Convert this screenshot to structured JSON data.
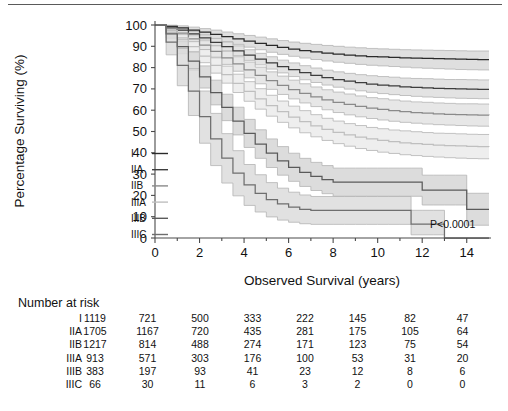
{
  "figure": {
    "p_value": "P<0.0001",
    "top_rule": true
  },
  "chart_data": {
    "type": "line",
    "title": "",
    "xlabel": "Observed Survival (years)",
    "ylabel": "Percentage Surviving (%)",
    "xlim": [
      0,
      15
    ],
    "ylim": [
      0,
      100
    ],
    "xticks": [
      0,
      2,
      4,
      6,
      8,
      10,
      12,
      14
    ],
    "xticklabels": [
      "0",
      "2",
      "4",
      "6",
      "8",
      "10",
      "12",
      "14"
    ],
    "yticks": [
      0,
      10,
      20,
      30,
      40,
      50,
      60,
      70,
      80,
      90,
      100
    ],
    "yticklabels": [
      "0",
      "10",
      "20",
      "30",
      "40",
      "50",
      "60",
      "70",
      "80",
      "90",
      "100"
    ],
    "grid": false,
    "legend_position": "inside-left",
    "annotation": "P<0.0001",
    "series": [
      {
        "name": "I",
        "color": "#2a2a2a",
        "band_color": "#d9d9d9",
        "x": [
          0,
          0.5,
          1,
          1.5,
          2,
          2.5,
          3,
          3.5,
          4,
          4.5,
          5,
          5.5,
          6,
          6.5,
          7,
          7.5,
          8,
          8.5,
          9,
          9.5,
          10,
          10.5,
          11,
          11.5,
          12,
          12.5,
          13,
          13.5,
          14,
          14.5,
          15
        ],
        "values": [
          100,
          99.4,
          98.6,
          97.6,
          96.6,
          95.6,
          94.5,
          93.5,
          92.4,
          91.4,
          90.4,
          89.5,
          88.7,
          88.0,
          87.4,
          86.8,
          86.3,
          85.9,
          85.5,
          85.2,
          85.0,
          84.8,
          84.6,
          84.4,
          84.3,
          84.2,
          84.1,
          84.0,
          83.9,
          83.8,
          83.8
        ],
        "lower": [
          100,
          98.6,
          97.4,
          96.1,
          94.8,
          93.5,
          92.2,
          90.9,
          89.6,
          88.4,
          87.2,
          86.2,
          85.3,
          84.5,
          83.8,
          83.1,
          82.5,
          82.0,
          81.5,
          81.1,
          80.8,
          80.5,
          80.2,
          79.9,
          79.7,
          79.5,
          79.3,
          79.1,
          79.0,
          78.9,
          78.8
        ],
        "upper": [
          100,
          99.9,
          99.6,
          99.0,
          98.3,
          97.6,
          96.7,
          95.9,
          95.1,
          94.3,
          93.5,
          92.7,
          92.0,
          91.4,
          90.9,
          90.4,
          90.0,
          89.6,
          89.3,
          89.0,
          88.8,
          88.6,
          88.4,
          88.3,
          88.2,
          88.1,
          88.0,
          87.9,
          87.8,
          87.8,
          87.8
        ]
      },
      {
        "name": "IIA",
        "color": "#3d3d3d",
        "band_color": "#dedede",
        "x": [
          0,
          0.5,
          1,
          1.5,
          2,
          2.5,
          3,
          3.5,
          4,
          4.5,
          5,
          5.5,
          6,
          6.5,
          7,
          7.5,
          8,
          8.5,
          9,
          9.5,
          10,
          10.5,
          11,
          11.5,
          12,
          12.5,
          13,
          13.5,
          14,
          14.5,
          15
        ],
        "values": [
          100,
          99.0,
          97.6,
          95.8,
          93.9,
          91.9,
          89.9,
          87.9,
          85.9,
          84.0,
          82.2,
          80.5,
          79.0,
          77.6,
          76.4,
          75.3,
          74.4,
          73.6,
          72.9,
          72.3,
          71.8,
          71.4,
          71.0,
          70.7,
          70.5,
          70.3,
          70.1,
          70.0,
          69.9,
          69.8,
          69.8
        ],
        "lower": [
          100,
          98.5,
          96.7,
          94.6,
          92.4,
          90.1,
          87.8,
          85.6,
          83.4,
          81.3,
          79.3,
          77.5,
          75.8,
          74.3,
          73.0,
          71.8,
          70.8,
          69.9,
          69.1,
          68.4,
          67.8,
          67.3,
          66.9,
          66.5,
          66.2,
          66.0,
          65.8,
          65.6,
          65.5,
          65.4,
          65.3
        ],
        "upper": [
          100,
          99.5,
          98.5,
          97.0,
          95.4,
          93.7,
          92.0,
          90.2,
          88.4,
          86.7,
          85.1,
          83.5,
          82.2,
          80.9,
          79.8,
          78.8,
          78.0,
          77.3,
          76.7,
          76.2,
          75.8,
          75.5,
          75.1,
          74.9,
          74.8,
          74.6,
          74.4,
          74.4,
          74.3,
          74.2,
          74.3
        ]
      },
      {
        "name": "IIB",
        "color": "#8a8a8a",
        "band_color": "#e3e3e3",
        "x": [
          0,
          0.5,
          1,
          1.5,
          2,
          2.5,
          3,
          3.5,
          4,
          4.5,
          5,
          5.5,
          6,
          6.5,
          7,
          7.5,
          8,
          8.5,
          9,
          9.5,
          10,
          10.5,
          11,
          11.5,
          12,
          12.5,
          13,
          13.5,
          14,
          14.5,
          15
        ],
        "values": [
          100,
          98.4,
          96.2,
          93.5,
          90.6,
          87.6,
          84.6,
          81.7,
          78.9,
          76.3,
          73.9,
          71.7,
          69.7,
          67.9,
          66.3,
          64.9,
          63.7,
          62.7,
          61.8,
          61.0,
          60.4,
          59.8,
          59.3,
          58.9,
          58.6,
          58.3,
          58.1,
          57.9,
          57.8,
          57.7,
          57.6
        ],
        "lower": [
          100,
          97.7,
          94.9,
          91.7,
          88.3,
          84.9,
          81.5,
          78.3,
          75.2,
          72.4,
          69.8,
          67.4,
          65.3,
          63.4,
          61.7,
          60.2,
          58.9,
          57.8,
          56.9,
          56.1,
          55.4,
          54.8,
          54.3,
          53.9,
          53.5,
          53.2,
          53.0,
          52.8,
          52.6,
          52.5,
          52.4
        ],
        "upper": [
          100,
          99.1,
          97.5,
          95.3,
          92.9,
          90.3,
          87.7,
          85.1,
          82.6,
          80.2,
          78.0,
          76.0,
          74.1,
          72.4,
          70.9,
          69.6,
          68.5,
          67.6,
          66.7,
          65.9,
          65.4,
          64.8,
          64.3,
          63.9,
          63.7,
          63.4,
          63.2,
          63.0,
          63.0,
          62.9,
          62.8
        ]
      },
      {
        "name": "IIIA",
        "color": "#bfbfbf",
        "band_color": "#ebebeb",
        "x": [
          0,
          0.5,
          1,
          1.5,
          2,
          2.5,
          3,
          3.5,
          4,
          4.5,
          5,
          5.5,
          6,
          6.5,
          7,
          7.5,
          8,
          8.5,
          9,
          9.5,
          10,
          10.5,
          11,
          11.5,
          12,
          12.5,
          13,
          13.5,
          14,
          14.5,
          15
        ],
        "values": [
          100,
          97.4,
          93.9,
          89.8,
          85.4,
          81.0,
          76.7,
          72.6,
          68.8,
          65.3,
          62.1,
          59.3,
          56.8,
          54.6,
          52.7,
          51.0,
          49.6,
          48.4,
          47.4,
          46.5,
          45.8,
          45.2,
          44.7,
          44.3,
          43.9,
          43.6,
          43.4,
          43.2,
          43.0,
          42.9,
          42.8
        ],
        "lower": [
          100,
          96.4,
          92.2,
          87.3,
          82.3,
          77.4,
          72.7,
          68.3,
          64.2,
          60.5,
          57.2,
          54.3,
          51.7,
          49.4,
          47.5,
          45.8,
          44.3,
          43.1,
          42.0,
          41.1,
          40.3,
          39.7,
          39.1,
          38.7,
          38.3,
          38.0,
          37.7,
          37.5,
          37.3,
          37.2,
          37.1
        ],
        "upper": [
          100,
          98.4,
          95.6,
          92.3,
          88.5,
          84.6,
          80.7,
          76.9,
          73.4,
          70.1,
          67.0,
          64.3,
          61.9,
          59.8,
          57.9,
          56.2,
          54.9,
          53.7,
          52.8,
          51.9,
          51.3,
          50.7,
          50.3,
          49.9,
          49.5,
          49.2,
          49.1,
          48.9,
          48.7,
          48.6,
          48.5
        ]
      },
      {
        "name": "IIIB",
        "color": "#5a5a5a",
        "band_color": "#d6d6d6",
        "x": [
          0,
          0.5,
          1,
          1.5,
          2,
          2.5,
          3,
          3.5,
          4,
          4.5,
          5,
          5.5,
          6,
          6.5,
          7,
          7.5,
          8,
          8.5,
          9,
          9.5,
          10,
          10.5,
          11,
          11.5,
          12,
          12.5,
          13,
          13.5,
          14,
          14.5,
          15
        ],
        "values": [
          100,
          95.8,
          89.9,
          83.0,
          75.6,
          68.3,
          61.3,
          54.9,
          49.1,
          44.1,
          39.8,
          36.2,
          33.2,
          30.8,
          28.9,
          27.4,
          26.2,
          26.2,
          26.2,
          26.2,
          26.2,
          26.2,
          26.2,
          26.2,
          22.5,
          22.5,
          22.5,
          22.5,
          13.5,
          13.5,
          13.5
        ],
        "lower": [
          100,
          93.8,
          86.5,
          78.6,
          70.4,
          62.5,
          55.1,
          48.4,
          42.5,
          37.4,
          33.1,
          29.5,
          26.6,
          24.2,
          22.3,
          20.8,
          19.6,
          19.6,
          19.6,
          19.6,
          19.6,
          19.6,
          19.6,
          19.6,
          15.5,
          15.5,
          15.5,
          15.5,
          6.0,
          6.0,
          6.0
        ],
        "upper": [
          100,
          97.8,
          93.3,
          87.4,
          80.8,
          74.1,
          67.5,
          61.4,
          55.7,
          50.8,
          46.5,
          42.9,
          39.8,
          37.4,
          35.5,
          34.0,
          32.8,
          32.8,
          32.8,
          32.8,
          32.8,
          32.8,
          32.8,
          32.8,
          29.5,
          29.5,
          29.5,
          29.5,
          21.0,
          21.0,
          21.0
        ]
      },
      {
        "name": "IIIC",
        "color": "#6e6e6e",
        "band_color": "#dcdcdc",
        "x": [
          0,
          0.5,
          1,
          1.5,
          2,
          2.5,
          3,
          3.5,
          4,
          4.5,
          5,
          5.5,
          6,
          6.5,
          7,
          7.5,
          8,
          8.5,
          9,
          9.5,
          10,
          10.5,
          11,
          11.5,
          12,
          12.5,
          13,
          13.5,
          14,
          14.5,
          15
        ],
        "values": [
          100,
          92.0,
          81.0,
          69.0,
          57.0,
          46.5,
          37.5,
          30.5,
          25.0,
          21.0,
          18.0,
          16.0,
          14.5,
          13.5,
          13.0,
          13.0,
          13.0,
          13.0,
          13.0,
          13.0,
          13.0,
          13.0,
          13.0,
          6.5,
          6.5,
          6.5,
          0.0,
          0.0,
          0.0,
          0.0,
          0.0
        ],
        "lower": [
          100,
          86.0,
          71.5,
          57.5,
          44.5,
          34.0,
          25.8,
          19.8,
          15.3,
          12.2,
          9.9,
          8.4,
          7.4,
          6.7,
          6.4,
          6.4,
          6.4,
          6.4,
          6.4,
          6.4,
          6.4,
          6.4,
          6.4,
          1.5,
          1.5,
          1.5,
          0.0,
          0.0,
          0.0,
          0.0,
          0.0
        ],
        "upper": [
          100,
          96.5,
          89.0,
          79.5,
          69.0,
          58.5,
          49.0,
          41.0,
          34.5,
          29.7,
          26.0,
          23.4,
          21.5,
          20.2,
          19.5,
          19.5,
          19.5,
          19.5,
          19.5,
          19.5,
          19.5,
          19.5,
          19.5,
          13.0,
          13.0,
          13.0,
          0.0,
          0.0,
          0.0,
          0.0,
          0.0
        ]
      }
    ]
  },
  "legend": {
    "items": [
      {
        "label": "I"
      },
      {
        "label": "IIA"
      },
      {
        "label": "IIB"
      },
      {
        "label": "IIIA"
      },
      {
        "label": "IIIB"
      },
      {
        "label": "IIIC"
      }
    ]
  },
  "risk_table": {
    "title": "Number at risk",
    "time_points": [
      0,
      2,
      4,
      6,
      8,
      10,
      12,
      14
    ],
    "rows": [
      {
        "label": "I",
        "counts": [
          "1119",
          "721",
          "500",
          "333",
          "222",
          "145",
          "82",
          "47"
        ]
      },
      {
        "label": "IIA",
        "counts": [
          "1705",
          "1167",
          "720",
          "435",
          "281",
          "175",
          "105",
          "64"
        ]
      },
      {
        "label": "IIB",
        "counts": [
          "1217",
          "814",
          "488",
          "274",
          "171",
          "123",
          "75",
          "54"
        ]
      },
      {
        "label": "IIIA",
        "counts": [
          "913",
          "571",
          "303",
          "176",
          "100",
          "53",
          "31",
          "20"
        ]
      },
      {
        "label": "IIIB",
        "counts": [
          "383",
          "197",
          "93",
          "41",
          "23",
          "12",
          "8",
          "6"
        ]
      },
      {
        "label": "IIIC",
        "counts": [
          "66",
          "30",
          "11",
          "6",
          "3",
          "2",
          "0",
          "0"
        ]
      }
    ]
  }
}
